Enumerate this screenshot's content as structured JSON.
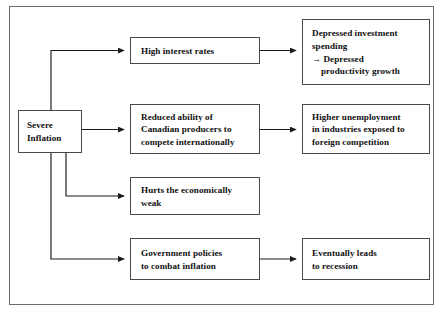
{
  "diagram": {
    "type": "flowchart",
    "frame": {
      "name": "outer-frame",
      "border_color": "#6e6e6e"
    },
    "box_border_color": "#4a4a4a",
    "text_color": "#101010",
    "background": "#ffffff",
    "nodes": [
      {
        "id": "severe-inflation",
        "lines": [
          "Severe",
          "Inflation"
        ],
        "column": "source"
      },
      {
        "id": "high-interest-rates",
        "lines": [
          "High interest rates"
        ],
        "column": "middle"
      },
      {
        "id": "reduced-ability",
        "lines": [
          "Reduced ability of",
          "Canadian producers to",
          "compete internationally"
        ],
        "column": "middle"
      },
      {
        "id": "hurts-economically-weak",
        "lines": [
          "Hurts the economically",
          "weak"
        ],
        "column": "middle"
      },
      {
        "id": "government-policies",
        "lines": [
          "Government policies",
          "to combat inflation"
        ],
        "column": "middle"
      },
      {
        "id": "depressed-investment",
        "lines": [
          "Depressed investment",
          "spending",
          "→ Depressed",
          "productivity growth"
        ],
        "column": "right"
      },
      {
        "id": "higher-unemployment",
        "lines": [
          "Higher unemployment",
          "in industries exposed to",
          "foreign competition"
        ],
        "column": "right"
      },
      {
        "id": "eventually-recession",
        "lines": [
          "Eventually leads",
          "to recession"
        ],
        "column": "right"
      }
    ],
    "edges": [
      {
        "from": "severe-inflation",
        "to": "high-interest-rates"
      },
      {
        "from": "severe-inflation",
        "to": "reduced-ability"
      },
      {
        "from": "severe-inflation",
        "to": "hurts-economically-weak"
      },
      {
        "from": "severe-inflation",
        "to": "government-policies"
      },
      {
        "from": "high-interest-rates",
        "to": "depressed-investment"
      },
      {
        "from": "reduced-ability",
        "to": "higher-unemployment"
      },
      {
        "from": "government-policies",
        "to": "eventually-recession"
      }
    ]
  }
}
